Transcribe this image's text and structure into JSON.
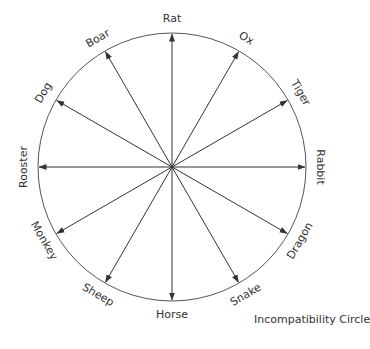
{
  "diagram": {
    "caption": "Incompatibility Circle",
    "center": {
      "x": 172,
      "y": 167
    },
    "radius": 134,
    "label_radius": 148,
    "colors": {
      "line": "#333333",
      "text": "#333333"
    },
    "nodes": [
      {
        "label": "Rat",
        "angle": 0
      },
      {
        "label": "Ox",
        "angle": 30
      },
      {
        "label": "Tiger",
        "angle": 60
      },
      {
        "label": "Rabbit",
        "angle": 90
      },
      {
        "label": "Dragon",
        "angle": 120
      },
      {
        "label": "Snake",
        "angle": 150
      },
      {
        "label": "Horse",
        "angle": 180
      },
      {
        "label": "Sheep",
        "angle": 210
      },
      {
        "label": "Monkey",
        "angle": 240
      },
      {
        "label": "Rooster",
        "angle": 270
      },
      {
        "label": "Dog",
        "angle": 300
      },
      {
        "label": "Boar",
        "angle": 330
      }
    ],
    "arrows_from": "center",
    "arrows_to": "each node on circle"
  }
}
